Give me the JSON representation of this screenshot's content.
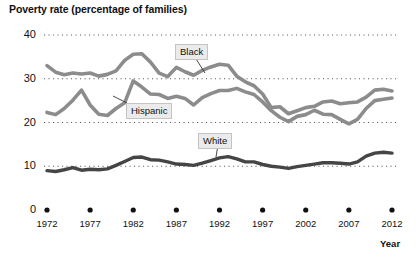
{
  "chart_data": {
    "type": "line",
    "title": "Poverty rate (percentage of families)",
    "xlabel": "Year",
    "ylabel": "",
    "ylim": [
      0,
      40
    ],
    "xlim": [
      1972,
      2012
    ],
    "grid": true,
    "grid_style": "dotted-horizontal",
    "legend_position": "inline-labels",
    "yticks": [
      "40",
      "30",
      "20",
      "10",
      "0"
    ],
    "ytick_values": [
      40,
      30,
      20,
      10,
      0
    ],
    "xticks": [
      "1972",
      "1977",
      "1982",
      "1987",
      "1992",
      "1997",
      "2002",
      "2007",
      "2012"
    ],
    "xtick_values": [
      1972,
      1977,
      1982,
      1987,
      1992,
      1997,
      2002,
      2007,
      2012
    ],
    "x": [
      1972,
      1973,
      1974,
      1975,
      1976,
      1977,
      1978,
      1979,
      1980,
      1981,
      1982,
      1983,
      1984,
      1985,
      1986,
      1987,
      1988,
      1989,
      1990,
      1991,
      1992,
      1993,
      1994,
      1995,
      1996,
      1997,
      1998,
      1999,
      2000,
      2001,
      2002,
      2003,
      2004,
      2005,
      2006,
      2007,
      2008,
      2009,
      2010,
      2011,
      2012
    ],
    "series": [
      {
        "name": "Black",
        "color": "#8c8c8c",
        "values": [
          33.0,
          31.5,
          30.9,
          31.3,
          31.1,
          31.3,
          30.6,
          31.0,
          31.8,
          34.2,
          35.6,
          35.7,
          33.8,
          31.3,
          30.5,
          32.6,
          31.6,
          30.8,
          31.9,
          32.7,
          33.3,
          33.1,
          30.6,
          29.3,
          28.4,
          26.5,
          23.4,
          23.6,
          22.0,
          22.7,
          23.4,
          23.7,
          24.7,
          24.9,
          24.3,
          24.5,
          24.7,
          25.8,
          27.4,
          27.6,
          27.2
        ]
      },
      {
        "name": "Hispanic",
        "color": "#8c8c8c",
        "values": [
          22.3,
          21.8,
          23.2,
          25.1,
          27.4,
          24.0,
          21.9,
          21.6,
          23.2,
          24.5,
          29.5,
          28.1,
          26.5,
          26.4,
          25.5,
          26.0,
          25.5,
          24.0,
          25.7,
          26.6,
          27.3,
          27.3,
          27.8,
          27.0,
          26.4,
          24.7,
          22.7,
          21.2,
          20.2,
          21.4,
          21.8,
          22.8,
          21.9,
          21.8,
          20.7,
          19.7,
          20.7,
          23.2,
          25.0,
          25.3,
          25.6
        ]
      },
      {
        "name": "White",
        "color": "#454545",
        "values": [
          9.0,
          8.8,
          9.2,
          9.7,
          9.1,
          9.3,
          9.2,
          9.4,
          10.2,
          11.1,
          12.0,
          12.1,
          11.5,
          11.4,
          11.0,
          10.5,
          10.4,
          10.2,
          10.7,
          11.3,
          11.9,
          12.2,
          11.7,
          11.0,
          11.0,
          10.4,
          10.0,
          9.8,
          9.5,
          9.9,
          10.2,
          10.5,
          10.8,
          10.8,
          10.7,
          10.5,
          11.0,
          12.3,
          13.0,
          13.2,
          13.0
        ]
      }
    ],
    "annotations": [
      {
        "text": "Black",
        "x_px": 175,
        "y_px": 44,
        "leader_to_x": 205,
        "leader_to_y": 73
      },
      {
        "text": "Hispanic",
        "x_px": 126,
        "y_px": 103,
        "leader_to_x": 113,
        "leader_to_y": 96
      },
      {
        "text": "White",
        "x_px": 198,
        "y_px": 133,
        "leader_to_x": 216,
        "leader_to_y": 157
      }
    ]
  },
  "axis": {
    "x_title": "Year"
  }
}
